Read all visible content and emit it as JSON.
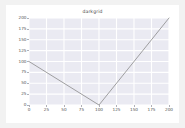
{
  "figure": {
    "background": "#ffffff",
    "page_background": "#f2f2f2"
  },
  "chart_data": {
    "type": "line",
    "title": "darkgrid",
    "xlabel": "",
    "ylabel": "",
    "xlim": [
      0,
      200
    ],
    "ylim": [
      0,
      200
    ],
    "xticks": [
      0,
      25,
      50,
      75,
      100,
      125,
      150,
      175,
      200
    ],
    "yticks": [
      0,
      25,
      50,
      75,
      100,
      125,
      150,
      175,
      200
    ],
    "xtick_labels": [
      "0",
      "25",
      "50",
      "75",
      "100",
      "125",
      "150",
      "175",
      "200"
    ],
    "ytick_labels": [
      "0",
      "25",
      "50",
      "75",
      "100",
      "125",
      "150",
      "175",
      "200"
    ],
    "grid": true,
    "grid_color": "#ffffff",
    "axes_facecolor": "#eaeaf2",
    "legend": null,
    "legend_position": "none",
    "series": [
      {
        "name": "series-1",
        "color": "#8a8a8a",
        "linewidth": 0.8,
        "x": [
          0,
          100,
          200
        ],
        "y": [
          100,
          0,
          200
        ]
      }
    ]
  }
}
